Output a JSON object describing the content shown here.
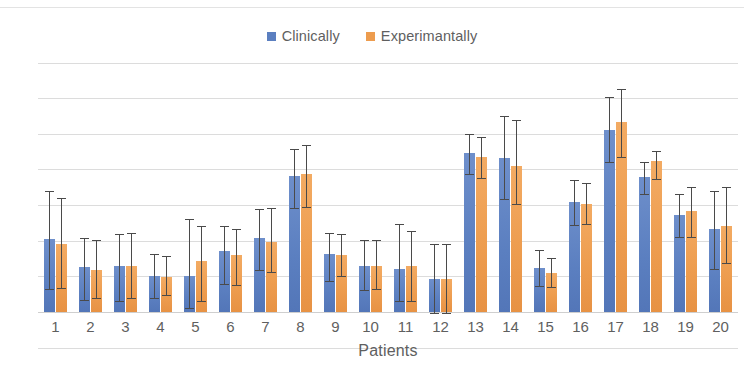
{
  "chart_data": {
    "type": "bar",
    "title": "",
    "xlabel": "Patients",
    "ylabel": "",
    "grid": true,
    "legend_position": "top-center",
    "ylim": [
      -5,
      35
    ],
    "yticks": [
      35,
      30,
      25,
      20,
      15,
      10,
      5,
      0,
      -5
    ],
    "ytick_labels": [
      "35",
      "30",
      "25",
      "20",
      "15",
      "10",
      "5",
      "0",
      "-5"
    ],
    "categories": [
      "1",
      "2",
      "3",
      "4",
      "5",
      "6",
      "7",
      "8",
      "9",
      "10",
      "11",
      "12",
      "13",
      "14",
      "15",
      "16",
      "17",
      "18",
      "19",
      "20"
    ],
    "error_bars": true,
    "series": [
      {
        "name": "Clinically",
        "color": "#5b7fc0",
        "values": [
          10.2,
          6.3,
          6.4,
          5.0,
          5.1,
          8.6,
          10.4,
          19.1,
          8.1,
          6.5,
          6.0,
          4.6,
          22.3,
          21.6,
          6.2,
          15.5,
          25.6,
          19.0,
          13.6,
          11.6
        ],
        "err_low": [
          7.0,
          4.6,
          4.9,
          3.0,
          4.6,
          4.7,
          4.5,
          4.5,
          3.7,
          3.4,
          4.5,
          4.7,
          3.0,
          5.8,
          2.5,
          3.3,
          4.6,
          2.5,
          3.1,
          5.5
        ],
        "err_high": [
          6.8,
          4.1,
          4.5,
          3.2,
          8.0,
          3.5,
          4.1,
          3.8,
          3.0,
          3.6,
          6.3,
          4.9,
          2.7,
          5.9,
          2.5,
          3.0,
          4.6,
          2.1,
          2.9,
          5.4
        ]
      },
      {
        "name": "Experimantally",
        "color": "#ed9c4e",
        "values": [
          9.6,
          5.9,
          6.5,
          4.9,
          7.1,
          8.0,
          9.8,
          19.3,
          8.0,
          6.5,
          6.4,
          4.6,
          21.7,
          20.5,
          5.5,
          15.1,
          26.7,
          21.2,
          14.1,
          12.0
        ],
        "err_low": [
          6.3,
          3.9,
          4.5,
          2.5,
          5.6,
          4.2,
          4.2,
          4.6,
          3.0,
          3.3,
          4.9,
          4.8,
          2.9,
          5.3,
          2.0,
          2.8,
          5.0,
          2.6,
          3.6,
          5.1
        ],
        "err_high": [
          6.4,
          4.2,
          4.6,
          3.0,
          5.0,
          3.6,
          4.8,
          4.1,
          3.0,
          3.6,
          5.0,
          5.0,
          2.9,
          6.5,
          2.1,
          3.0,
          4.6,
          1.4,
          3.5,
          5.6
        ]
      }
    ]
  },
  "legend": {
    "entries": [
      {
        "label": "Clinically"
      },
      {
        "label": "Experimantally"
      }
    ]
  },
  "axis": {
    "x_title": "Patients"
  }
}
